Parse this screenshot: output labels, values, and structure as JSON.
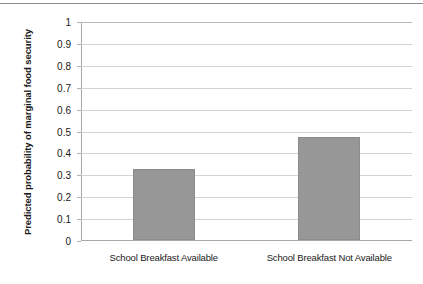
{
  "chart_data": {
    "type": "bar",
    "title": "",
    "subtitle": "",
    "xlabel": "",
    "ylabel": "Predicted probability of marginal food security",
    "categories": [
      "School Breakfast Available",
      "School Breakfast Not Available"
    ],
    "values": [
      0.325,
      0.47
    ],
    "ylim": [
      0,
      1
    ],
    "ytick_labels": [
      "0",
      "0.1",
      "0.2",
      "0.3",
      "0.4",
      "0.5",
      "0.6",
      "0.7",
      "0.8",
      "0.9",
      "1"
    ],
    "ytick_values": [
      0,
      0.1,
      0.2,
      0.3,
      0.4,
      0.5,
      0.6,
      0.7,
      0.8,
      0.9,
      1
    ],
    "grid": true,
    "grid_axis": "y",
    "legend": false,
    "legend_position": "none",
    "bar_color": "#979797",
    "bar_border_color": "#8c8c8c",
    "gridline_color": "#d3d3d3",
    "axis_color": "#a8a8a8",
    "text_color": "#1a1a1a",
    "background": "#ffffff",
    "annotations": []
  }
}
